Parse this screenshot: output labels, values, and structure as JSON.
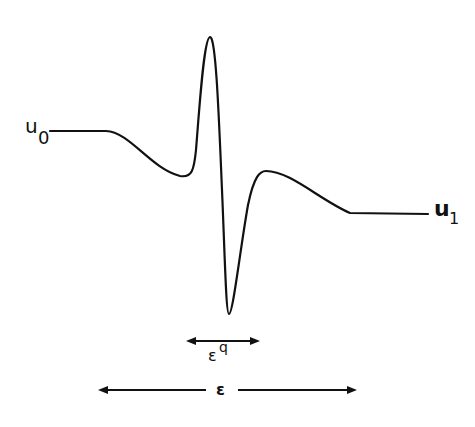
{
  "figure": {
    "left_state_label": "u",
    "left_state_subscript": "0",
    "right_state_label": "u",
    "right_state_subscript": "1",
    "inner_width_label": "ε",
    "inner_width_exponent": "q",
    "outer_width_label": "ε"
  },
  "colors": {
    "ink": "#111111",
    "background": "#ffffff"
  }
}
